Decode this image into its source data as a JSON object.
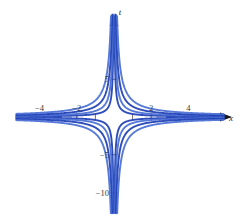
{
  "figure": {
    "title": "",
    "background_color": "#ffffff",
    "curve_color": "#1f3fb5",
    "curve_color_light": "#4a6fd4",
    "axis_color": "#8a8a8a",
    "axis_accent_color": "#c8a06a",
    "text_color": "#2b2b2b"
  },
  "axes": {
    "x_axis_label": "x",
    "y_axis_label": "t",
    "x_ticks": [
      -5,
      -4,
      -3,
      -2,
      -1,
      1,
      2,
      3,
      4,
      5
    ],
    "x_tick_labels": [
      {
        "value": -4,
        "text": "−4"
      },
      {
        "value": -2,
        "text": "−2"
      },
      {
        "value": 2,
        "text": "2"
      },
      {
        "value": 4,
        "text": "4"
      }
    ],
    "y_ticks": [
      -10,
      -5,
      5
    ],
    "y_tick_labels": [
      {
        "value": 5,
        "text": "5"
      },
      {
        "value": -5,
        "text": "−5"
      },
      {
        "value": -10,
        "text": "−10"
      }
    ],
    "xlim": [
      -5.6,
      5.6
    ],
    "ylim": [
      -12.5,
      12.5
    ],
    "grid": false,
    "arrows": [
      "x-positive",
      "t-positive"
    ]
  },
  "chart_data": {
    "type": "line",
    "title": "",
    "xlabel": "x",
    "ylabel": "t",
    "xlim": [
      -5.6,
      5.6
    ],
    "ylim": [
      -12.5,
      12.5
    ],
    "grid": false,
    "legend": "none",
    "x_ticks": [
      -4,
      -2,
      2,
      4
    ],
    "y_ticks": [
      5,
      -5,
      -10
    ],
    "series": [
      {
        "name": "c = 0.4",
        "c": 0.4,
        "values_note": "t = 0.4/x"
      },
      {
        "name": "c = 0.8",
        "c": 0.8,
        "values_note": "t = 0.8/x"
      },
      {
        "name": "c = 1.4",
        "c": 1.4,
        "values_note": "t = 1.4/x"
      },
      {
        "name": "c = 2.2",
        "c": 2.2,
        "values_note": "t = 2.2/x"
      },
      {
        "name": "c = -0.4",
        "c": -0.4,
        "values_note": "t = -0.4/x"
      },
      {
        "name": "c = -0.8",
        "c": -0.8,
        "values_note": "t = -0.8/x"
      },
      {
        "name": "c = -1.4",
        "c": -1.4,
        "values_note": "t = -1.4/x"
      },
      {
        "name": "c = -2.2",
        "c": -2.2,
        "values_note": "t = -2.2/x"
      }
    ]
  }
}
